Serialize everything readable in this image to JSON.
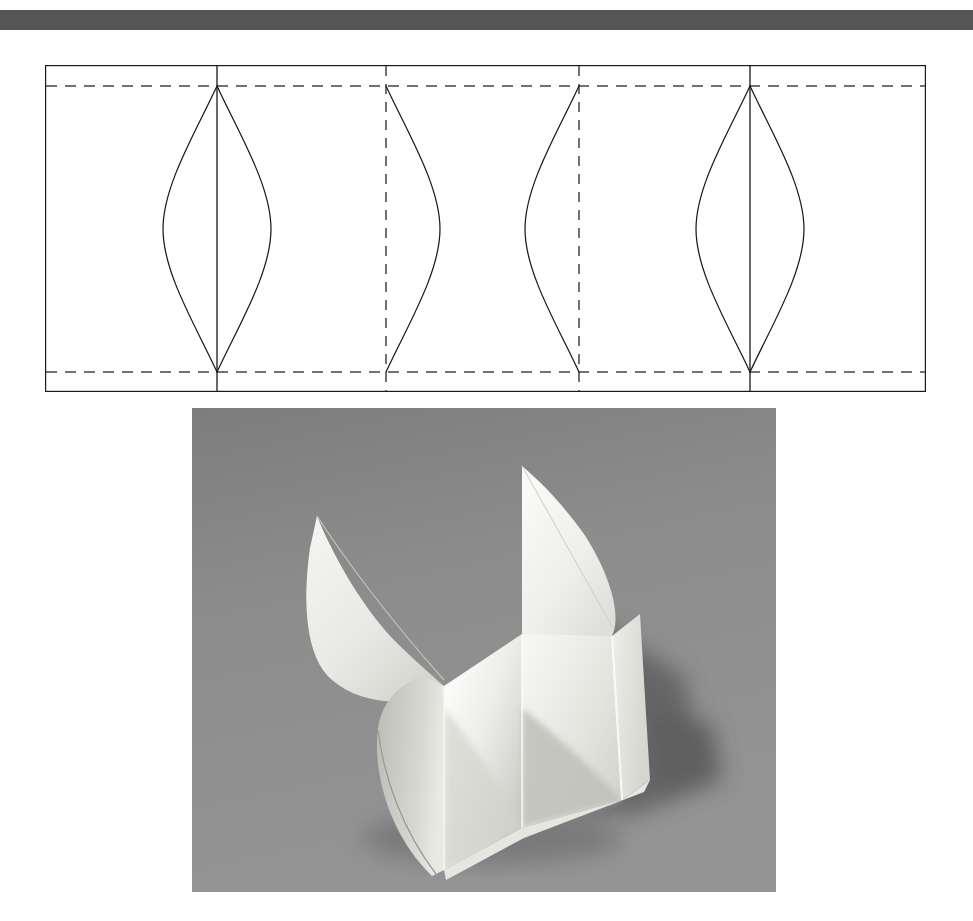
{
  "page": {
    "background_color": "#ffffff",
    "width": 973,
    "height": 921,
    "title": "Folded paper form: development pattern and finished model"
  },
  "top_rule": {
    "name": "horizontal-rule",
    "color": "#555555",
    "x": 0,
    "y": 10,
    "width": 973,
    "height": 20
  },
  "pattern_figure": {
    "caption": "",
    "description": "Flat development: rectangular strip divided by four vertical crease lines, with upper and lower horizontal fold lines and four lens-shaped curved cut lines.",
    "stroke_color": "#1a1a1a",
    "dash_color": "#444444",
    "fill_color": "#ffffff",
    "frame": {
      "x": 45,
      "y": 65,
      "width": 881,
      "height": 327
    },
    "horizontal_fold_lines": [
      {
        "label": "upper-fold-line",
        "y": 21,
        "style": "dashed"
      },
      {
        "label": "lower-fold-line",
        "y": 307,
        "style": "dashed"
      }
    ],
    "vertical_crease_lines": [
      {
        "label": "crease-1",
        "x": 172,
        "style": "solid"
      },
      {
        "label": "crease-2",
        "x": 341,
        "style": "dashed"
      },
      {
        "label": "crease-3",
        "x": 534,
        "style": "dashed"
      },
      {
        "label": "crease-4",
        "x": 705,
        "style": "solid"
      }
    ],
    "curved_cut_lines": [
      {
        "label": "lens-1",
        "center_x": 172,
        "half_width": 54,
        "top_y": 21,
        "bottom_y": 307,
        "kind": "full-lens"
      },
      {
        "label": "arc-2",
        "center_x": 341,
        "half_width": 54,
        "top_y": 21,
        "bottom_y": 307,
        "kind": "right-arc"
      },
      {
        "label": "arc-3",
        "center_x": 534,
        "half_width": 54,
        "top_y": 21,
        "bottom_y": 307,
        "kind": "left-arc"
      },
      {
        "label": "lens-4",
        "center_x": 705,
        "half_width": 54,
        "top_y": 21,
        "bottom_y": 307,
        "kind": "full-lens"
      }
    ]
  },
  "photo_figure": {
    "caption": "",
    "description": "Black and white photograph of a white paper model folded from the pattern: a square-cornered trough with two curved pointed flaps rising from the back edges, casting a soft shadow to the right on a mid-grey ground.",
    "frame": {
      "x": 192,
      "y": 408,
      "width": 584,
      "height": 484
    },
    "background_color": "#8c8c8c",
    "paper_highlight_color": "#f2f2f0",
    "paper_midtone_color": "#dcdcd8",
    "paper_shade_color": "#bdbdb8",
    "shadow_color": "#5e5e5e"
  }
}
